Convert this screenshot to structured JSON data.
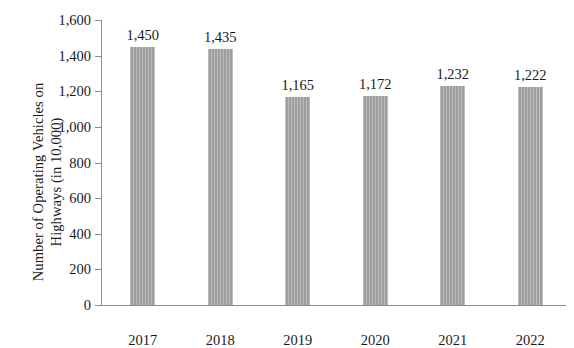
{
  "chart_data": {
    "type": "bar",
    "title": "",
    "xlabel": "",
    "ylabel": "Number of Operating Vehicles on Highways (in 10,000)",
    "ylabel_lines": [
      "Number of Operating Vehicles on",
      "Highways (in 10,000)"
    ],
    "categories": [
      "2017",
      "2018",
      "2019",
      "2020",
      "2021",
      "2022"
    ],
    "values": [
      1450,
      1435,
      1165,
      1172,
      1232,
      1222
    ],
    "value_labels": [
      "1,450",
      "1,435",
      "1,165",
      "1,172",
      "1,232",
      "1,222"
    ],
    "ylim": [
      0,
      1600
    ],
    "ytick_values": [
      0,
      200,
      400,
      600,
      800,
      1000,
      1200,
      1400,
      1600
    ],
    "ytick_labels": [
      "0",
      "200",
      "400",
      "600",
      "800",
      "1,000",
      "1,200",
      "1,400",
      "1,600"
    ],
    "grid": false,
    "legend": false,
    "legend_position": "none",
    "bar_color": "#9d9d9d",
    "axis_color": "#8c8c8c",
    "text_color": "#1a1a1a"
  }
}
